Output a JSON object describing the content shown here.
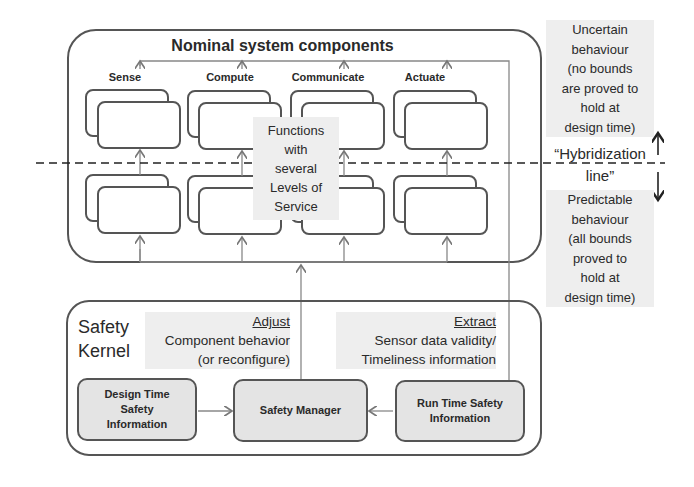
{
  "nominal": {
    "title": "Nominal system components",
    "columns": [
      "Sense",
      "Compute",
      "Communicate",
      "Actuate"
    ],
    "center_note": [
      "Functions",
      "with",
      "several",
      "Levels of",
      "Service"
    ]
  },
  "hybridization": {
    "upper_note": [
      "Uncertain",
      "behaviour",
      "(no bounds",
      "are proved to",
      "hold at",
      "design time)"
    ],
    "line_label": [
      "“Hybridization",
      "line”"
    ],
    "lower_note": [
      "Predictable",
      "behaviour",
      "(all bounds",
      "proved to",
      "hold at",
      "design time)"
    ]
  },
  "kernel": {
    "title": [
      "Safety",
      "Kernel"
    ],
    "adjust": {
      "heading": "Adjust",
      "lines": [
        "Component behavior",
        "(or reconfigure)"
      ]
    },
    "extract": {
      "heading": "Extract",
      "lines": [
        "Sensor data validity/",
        "Timeliness information"
      ]
    },
    "boxes": {
      "design_time": [
        "Design Time",
        "Safety",
        "Information"
      ],
      "manager": "Safety Manager",
      "run_time": [
        "Run Time Safety",
        "Information"
      ]
    }
  },
  "colors": {
    "stroke": "#555555",
    "fill": "#e4e4e4",
    "shade": "#eeeeee"
  }
}
